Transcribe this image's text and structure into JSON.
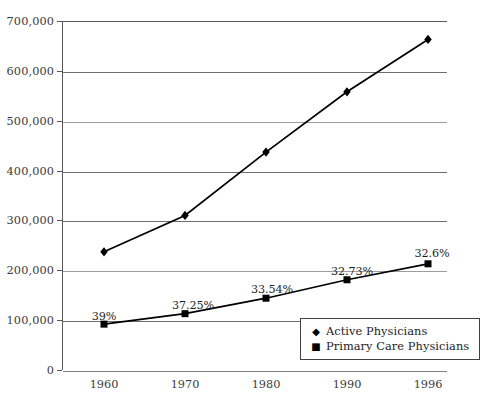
{
  "chart_data": {
    "type": "line",
    "title": "",
    "subtitle": "",
    "xlabel": "",
    "ylabel": "",
    "categories": [
      "1960",
      "1970",
      "1980",
      "1990",
      "1996"
    ],
    "x": [
      1960,
      1970,
      1980,
      1990,
      1996
    ],
    "ylim": [
      0,
      700000
    ],
    "ytick_labels": [
      "0",
      "100,000",
      "200,000",
      "300,000",
      "400,000",
      "500,000",
      "600,000",
      "700,000"
    ],
    "ytick_values": [
      0,
      100000,
      200000,
      300000,
      400000,
      500000,
      600000,
      700000
    ],
    "grid": true,
    "grid_axis": "y",
    "legend_position": "inside lower-right",
    "series": [
      {
        "name": "Active Physicians",
        "marker": "diamond",
        "color": "#000000",
        "values": [
          237000,
          310000,
          437000,
          558000,
          663000
        ],
        "point_labels": [
          "",
          "",
          "",
          "",
          ""
        ]
      },
      {
        "name": "Primary Care Physicians",
        "marker": "square",
        "color": "#000000",
        "values": [
          92000,
          113000,
          144000,
          181000,
          213000
        ],
        "point_labels": [
          "39%",
          "37.25%",
          "33.54%",
          "32.73%",
          "32.6%"
        ]
      }
    ],
    "annotations": [
      {
        "text": "39%",
        "series": "Primary Care Physicians",
        "category": "1960"
      },
      {
        "text": "37.25%",
        "series": "Primary Care Physicians",
        "category": "1970"
      },
      {
        "text": "33.54%",
        "series": "Primary Care Physicians",
        "category": "1980"
      },
      {
        "text": "32.73%",
        "series": "Primary Care Physicians",
        "category": "1990"
      },
      {
        "text": "32.6%",
        "series": "Primary Care Physicians",
        "category": "1996"
      }
    ]
  },
  "legend": {
    "items": [
      {
        "marker_glyph": "◆",
        "label": "Active Physicians",
        "icon": "diamond-marker-icon"
      },
      {
        "marker_glyph": "■",
        "label": "Primary Care Physicians",
        "icon": "square-marker-icon"
      }
    ]
  },
  "colors": {
    "series_line": "#000000",
    "axis": "#58585a",
    "gridline": "#6e6f71",
    "gridline_light": "#9c9da0",
    "text": "#1c1c1e",
    "tick_text": "#3b3b3d",
    "background": "#ffffff"
  }
}
